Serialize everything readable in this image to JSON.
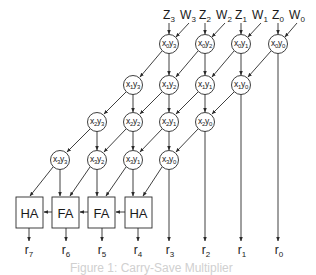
{
  "figure": {
    "caption": "Figure 1: Carry-Save Multiplier",
    "colors": {
      "stroke": "#2a2a2a",
      "text": "#1a1a1a",
      "caption": "#d0d0d0",
      "background": "#ffffff"
    }
  },
  "inputs": [
    {
      "z": "Z",
      "z_sub": "3",
      "w": "W",
      "w_sub": "3"
    },
    {
      "z": "Z",
      "z_sub": "2",
      "w": "W",
      "w_sub": "2"
    },
    {
      "z": "Z",
      "z_sub": "1",
      "w": "W",
      "w_sub": "1"
    },
    {
      "z": "Z",
      "z_sub": "0",
      "w": "W",
      "w_sub": "0"
    }
  ],
  "cells": {
    "row0": [
      {
        "x": "x",
        "xs": "0",
        "y": "y",
        "ys": "3"
      },
      {
        "x": "x",
        "xs": "0",
        "y": "y",
        "ys": "2"
      },
      {
        "x": "x",
        "xs": "0",
        "y": "y",
        "ys": "1"
      },
      {
        "x": "x",
        "xs": "0",
        "y": "y",
        "ys": "0"
      }
    ],
    "row1": [
      {
        "x": "x",
        "xs": "1",
        "y": "y",
        "ys": "3"
      },
      {
        "x": "x",
        "xs": "1",
        "y": "y",
        "ys": "2"
      },
      {
        "x": "x",
        "xs": "1",
        "y": "y",
        "ys": "1"
      },
      {
        "x": "x",
        "xs": "1",
        "y": "y",
        "ys": "0"
      }
    ],
    "row2": [
      {
        "x": "x",
        "xs": "2",
        "y": "y",
        "ys": "3"
      },
      {
        "x": "x",
        "xs": "2",
        "y": "y",
        "ys": "2"
      },
      {
        "x": "x",
        "xs": "2",
        "y": "y",
        "ys": "1"
      },
      {
        "x": "x",
        "xs": "2",
        "y": "y",
        "ys": "0"
      }
    ],
    "row3": [
      {
        "x": "x",
        "xs": "3",
        "y": "y",
        "ys": "3"
      },
      {
        "x": "x",
        "xs": "3",
        "y": "y",
        "ys": "2"
      },
      {
        "x": "x",
        "xs": "3",
        "y": "y",
        "ys": "1"
      },
      {
        "x": "x",
        "xs": "3",
        "y": "y",
        "ys": "0"
      }
    ]
  },
  "adders": [
    {
      "label": "HA"
    },
    {
      "label": "FA"
    },
    {
      "label": "FA"
    },
    {
      "label": "HA"
    }
  ],
  "outputs": [
    {
      "r": "r",
      "sub": "7"
    },
    {
      "r": "r",
      "sub": "6"
    },
    {
      "r": "r",
      "sub": "5"
    },
    {
      "r": "r",
      "sub": "4"
    },
    {
      "r": "r",
      "sub": "3"
    },
    {
      "r": "r",
      "sub": "2"
    },
    {
      "r": "r",
      "sub": "1"
    },
    {
      "r": "r",
      "sub": "0"
    }
  ]
}
